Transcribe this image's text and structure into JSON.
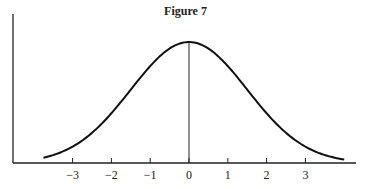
{
  "figure": {
    "title": "Figure 7"
  },
  "chart_data": {
    "type": "line",
    "title": "Figure 7",
    "subtitle": "",
    "xlabel": "",
    "ylabel": "",
    "x_ticks": [
      -3,
      -2,
      -1,
      0,
      1,
      2,
      3
    ],
    "x_tick_labels": [
      "−3",
      "−2",
      "−1",
      "0",
      "1",
      "2",
      "3"
    ],
    "xlim": [
      -4.5,
      4.3
    ],
    "ylim": [
      0,
      1.2
    ],
    "grid": false,
    "legend": null,
    "series": [
      {
        "name": "density",
        "x": [
          -3.75,
          -3.5,
          -3,
          -2.5,
          -2,
          -1.5,
          -1,
          -0.5,
          0,
          0.5,
          1,
          1.5,
          2,
          2.5,
          3,
          3.5,
          4.0
        ],
        "y": [
          0.04,
          0.07,
          0.14,
          0.25,
          0.41,
          0.61,
          0.8,
          0.95,
          1.0,
          0.95,
          0.8,
          0.61,
          0.41,
          0.25,
          0.14,
          0.07,
          0.03
        ]
      }
    ],
    "annotations": [
      {
        "type": "vertical-line",
        "x": 0,
        "from": 0,
        "to": 1.0
      }
    ]
  }
}
